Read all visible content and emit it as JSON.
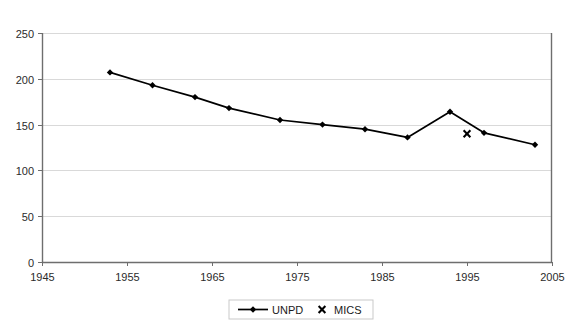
{
  "chart_data": {
    "type": "line",
    "title": "",
    "subtitle": "",
    "xlabel": "",
    "ylabel": "",
    "xlim": [
      1945,
      2005
    ],
    "ylim": [
      0,
      250
    ],
    "grid": true,
    "grid_axis": "y",
    "legend_position": "bottom-center",
    "x_ticks": [
      "1945",
      "1955",
      "1965",
      "1975",
      "1985",
      "1995",
      "2005"
    ],
    "x_tick_values": [
      1945,
      1955,
      1965,
      1975,
      1985,
      1995,
      2005
    ],
    "y_ticks": [
      "0",
      "50",
      "100",
      "150",
      "200",
      "250"
    ],
    "y_tick_values": [
      0,
      50,
      100,
      150,
      200,
      250
    ],
    "series": [
      {
        "name": "UNPD",
        "marker": "diamond",
        "color": "#000000",
        "x": [
          1953,
          1958,
          1963,
          1967,
          1973,
          1978,
          1983,
          1988,
          1993,
          1997,
          2003
        ],
        "values": [
          207,
          193,
          180,
          168,
          155,
          150,
          145,
          136,
          164,
          141,
          128
        ]
      },
      {
        "name": "MICS",
        "marker": "x",
        "color": "#000000",
        "x": [
          1995
        ],
        "values": [
          140
        ]
      }
    ],
    "legend": [
      {
        "label": "UNPD",
        "marker": "line-diamond"
      },
      {
        "label": "MICS",
        "marker": "x"
      }
    ]
  },
  "axes": {
    "y_axis_name": "y-axis",
    "x_axis_name": "x-axis"
  }
}
